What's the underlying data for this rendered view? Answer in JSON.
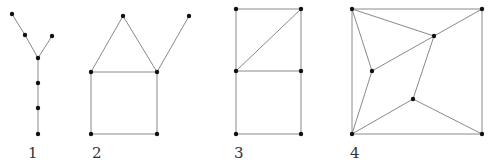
{
  "figure": {
    "colors": {
      "edge": "#8a8a8a",
      "node": "#111111",
      "label": "#333333",
      "background": "#ffffff"
    },
    "graphs": [
      {
        "label": "1",
        "label_pos": [
          28,
          158
        ],
        "nodes": [
          [
            12,
            14
          ],
          [
            25,
            35
          ],
          [
            52,
            36
          ],
          [
            38,
            58
          ],
          [
            38,
            83
          ],
          [
            38,
            108
          ],
          [
            38,
            134
          ]
        ],
        "edges": [
          [
            0,
            1
          ],
          [
            1,
            3
          ],
          [
            2,
            3
          ],
          [
            3,
            4
          ],
          [
            4,
            5
          ],
          [
            5,
            6
          ]
        ]
      },
      {
        "label": "2",
        "label_pos": [
          92,
          158
        ],
        "nodes": [
          [
            123,
            16
          ],
          [
            189,
            16
          ],
          [
            91,
            72
          ],
          [
            157,
            72
          ],
          [
            91,
            134
          ],
          [
            157,
            134
          ]
        ],
        "edges": [
          [
            0,
            2
          ],
          [
            0,
            3
          ],
          [
            1,
            3
          ],
          [
            2,
            3
          ],
          [
            2,
            4
          ],
          [
            3,
            5
          ],
          [
            4,
            5
          ]
        ]
      },
      {
        "label": "3",
        "label_pos": [
          234,
          158
        ],
        "nodes": [
          [
            236,
            9
          ],
          [
            301,
            9
          ],
          [
            236,
            71
          ],
          [
            301,
            71
          ],
          [
            236,
            134
          ],
          [
            301,
            134
          ]
        ],
        "edges": [
          [
            0,
            1
          ],
          [
            0,
            2
          ],
          [
            1,
            3
          ],
          [
            1,
            2
          ],
          [
            2,
            3
          ],
          [
            2,
            4
          ],
          [
            3,
            5
          ],
          [
            4,
            5
          ]
        ]
      },
      {
        "label": "4",
        "label_pos": [
          350,
          158
        ],
        "nodes": [
          [
            352,
            9
          ],
          [
            482,
            9
          ],
          [
            434,
            36
          ],
          [
            372,
            71
          ],
          [
            413,
            99
          ],
          [
            352,
            134
          ],
          [
            482,
            134
          ]
        ],
        "edges": [
          [
            0,
            1
          ],
          [
            1,
            6
          ],
          [
            6,
            5
          ],
          [
            5,
            0
          ],
          [
            0,
            2
          ],
          [
            1,
            2
          ],
          [
            2,
            3
          ],
          [
            2,
            4
          ],
          [
            0,
            3
          ],
          [
            3,
            5
          ],
          [
            5,
            4
          ],
          [
            4,
            6
          ]
        ]
      }
    ]
  }
}
